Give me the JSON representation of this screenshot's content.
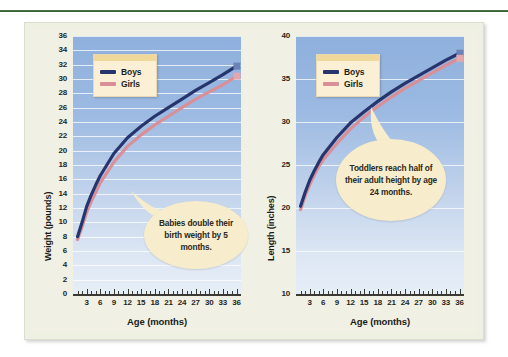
{
  "figure": {
    "background_color": "#f0f1e4",
    "accent_rule_color": "#3f6b3b",
    "boys_color": "#27356e",
    "girls_color": "#d98f98",
    "plot_fill_top": "#8fb0dd",
    "plot_fill_bottom": "#e6eef7"
  },
  "charts": [
    {
      "id": "weight-chart",
      "legend": {
        "title": "",
        "entries": [
          "Boys",
          "Girls"
        ]
      },
      "callout": "Babies double their birth weight by 5 months.",
      "chart_data": {
        "type": "line",
        "title": "",
        "xlabel": "Age (months)",
        "ylabel": "Weight (pounds)",
        "xlim": [
          0,
          37
        ],
        "ylim": [
          0,
          36
        ],
        "grid": true,
        "legend_position": "upper-left",
        "xticks": [
          3,
          6,
          9,
          12,
          15,
          18,
          21,
          24,
          27,
          30,
          33,
          36
        ],
        "xtick_labels": [
          "3",
          "6",
          "9",
          "12",
          "15",
          "18",
          "21",
          "24",
          "27",
          "30",
          "33",
          "36"
        ],
        "yticks": [
          0,
          2,
          4,
          6,
          8,
          10,
          12,
          14,
          16,
          18,
          20,
          22,
          24,
          26,
          28,
          30,
          32,
          34,
          36
        ],
        "ytick_labels": [
          "0",
          "2",
          "4",
          "6",
          "8",
          "10",
          "12",
          "14",
          "16",
          "18",
          "20",
          "22",
          "24",
          "26",
          "28",
          "30",
          "32",
          "34",
          "36"
        ],
        "x": [
          1,
          2,
          3,
          4,
          5,
          6,
          9,
          12,
          15,
          18,
          21,
          24,
          27,
          30,
          33,
          36
        ],
        "series": [
          {
            "name": "Boys",
            "values": [
              8.0,
              10.0,
              12.2,
              13.8,
              15.2,
              16.5,
              19.6,
              21.8,
              23.4,
              24.8,
              26.0,
              27.2,
              28.4,
              29.5,
              30.6,
              31.8
            ]
          },
          {
            "name": "Girls",
            "values": [
              7.6,
              9.4,
              11.4,
              12.9,
              14.2,
              15.5,
              18.4,
              20.6,
              22.2,
              23.6,
              24.8,
              26.0,
              27.2,
              28.2,
              29.2,
              30.4
            ]
          }
        ]
      }
    },
    {
      "id": "length-chart",
      "legend": {
        "title": "",
        "entries": [
          "Boys",
          "Girls"
        ]
      },
      "callout": "Toddlers reach half of their adult height by age 24 months.",
      "chart_data": {
        "type": "line",
        "title": "",
        "xlabel": "Age (months)",
        "ylabel": "Length (inches)",
        "xlim": [
          0,
          37
        ],
        "ylim": [
          10,
          40
        ],
        "grid": true,
        "legend_position": "upper-left",
        "xticks": [
          3,
          6,
          9,
          12,
          15,
          18,
          21,
          24,
          27,
          30,
          33,
          36
        ],
        "xtick_labels": [
          "3",
          "6",
          "9",
          "12",
          "15",
          "18",
          "21",
          "24",
          "27",
          "30",
          "33",
          "36"
        ],
        "yticks": [
          10,
          15,
          20,
          25,
          30,
          35,
          40
        ],
        "ytick_labels": [
          "10",
          "15",
          "20",
          "25",
          "30",
          "35",
          "40"
        ],
        "x": [
          1,
          2,
          3,
          4,
          5,
          6,
          9,
          12,
          15,
          18,
          21,
          24,
          27,
          30,
          33,
          36
        ],
        "series": [
          {
            "name": "Boys",
            "values": [
              20.2,
              21.8,
              23.2,
              24.3,
              25.3,
              26.2,
              28.2,
              29.9,
              31.2,
              32.4,
              33.5,
              34.5,
              35.4,
              36.3,
              37.2,
              38.0
            ]
          },
          {
            "name": "Girls",
            "values": [
              19.8,
              21.4,
              22.7,
              23.8,
              24.8,
              25.6,
              27.5,
              29.2,
              30.6,
              31.8,
              32.9,
              33.9,
              34.8,
              35.7,
              36.6,
              37.4
            ]
          }
        ]
      }
    }
  ]
}
